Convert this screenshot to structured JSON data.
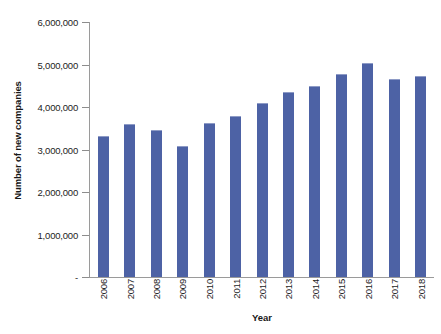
{
  "chart_data": {
    "type": "bar",
    "title": "",
    "xlabel": "Year",
    "ylabel": "Number of new companies",
    "categories": [
      "2006",
      "2007",
      "2008",
      "2009",
      "2010",
      "2011",
      "2012",
      "2013",
      "2014",
      "2015",
      "2016",
      "2017",
      "2018"
    ],
    "values": [
      3320000,
      3600000,
      3460000,
      3080000,
      3620000,
      3790000,
      4090000,
      4350000,
      4500000,
      4780000,
      5040000,
      4660000,
      4730000
    ],
    "series": [
      {
        "name": "Number of new companies",
        "values": [
          3320000,
          3600000,
          3460000,
          3080000,
          3620000,
          3790000,
          4090000,
          4350000,
          4500000,
          4780000,
          5040000,
          4660000,
          4730000
        ]
      }
    ],
    "ylim": [
      0,
      6000000
    ],
    "ytick_values": [
      0,
      1000000,
      2000000,
      3000000,
      4000000,
      5000000,
      6000000
    ],
    "ytick_labels": [
      "-",
      "1,000,000",
      "2,000,000",
      "3,000,000",
      "4,000,000",
      "5,000,000",
      "6,000,000"
    ],
    "grid": false,
    "legend": false,
    "legend_position": "none",
    "bar_color": "#4d62a5",
    "axis_color": "#9a9a9a",
    "background_color": "#ffffff",
    "xtick_rotation": -90
  },
  "axes": {
    "y_title": "Number of new companies",
    "x_title": "Year"
  },
  "title_remnant": ""
}
